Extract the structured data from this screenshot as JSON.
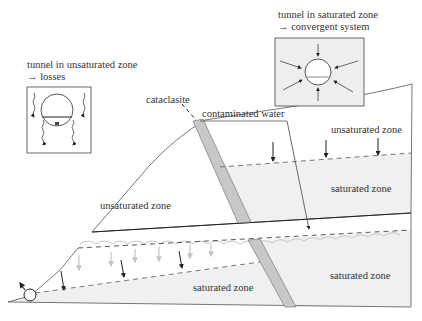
{
  "insets": {
    "unsaturated": {
      "title_line1": "tunnel in unsaturated zone",
      "title_line2": "→ losses"
    },
    "saturated": {
      "title_line1": "tunnel in saturated zone",
      "title_line2": "→ convergent system"
    }
  },
  "labels": {
    "cataclasite": "cataclasite",
    "contaminated_water": "contaminated water",
    "upper_left_unsaturated": "unsaturated zone",
    "upper_right_unsaturated": "unsaturated zone",
    "upper_right_saturated": "saturated zone",
    "lower_left_saturated": "saturated zone",
    "lower_right_saturated": "saturated zone"
  },
  "colors": {
    "line": "#555555",
    "saturated_fill": "#eef0f2",
    "inset_fill": "#eceef0",
    "cataclasite_fill": "#c8c8c8",
    "seepage_arrow": "#c8c8c8",
    "water_arrow": "#222222"
  }
}
